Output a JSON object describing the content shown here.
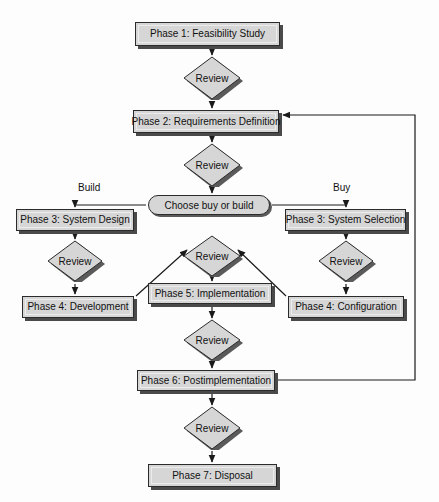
{
  "diagram": {
    "colors": {
      "node_fill": "#d6d6d6",
      "node_border": "#2b2b2b",
      "shadow": "#4a4a4a",
      "line": "#1a1a1a",
      "background": "#fdfdfd"
    },
    "process_nodes": [
      {
        "id": "phase1",
        "label": "Phase 1: Feasibility Study",
        "x": 135,
        "y": 22,
        "w": 145,
        "h": 24
      },
      {
        "id": "phase2",
        "label": "Phase 2: Requirements Definition",
        "x": 133,
        "y": 110,
        "w": 146,
        "h": 23
      },
      {
        "id": "phase3build",
        "label": "Phase 3: System Design",
        "x": 16,
        "y": 209,
        "w": 118,
        "h": 22
      },
      {
        "id": "phase3buy",
        "label": "Phase 3: System Selection",
        "x": 285,
        "y": 209,
        "w": 121,
        "h": 22
      },
      {
        "id": "phase4build",
        "label": "Phase 4: Development",
        "x": 22,
        "y": 296,
        "w": 112,
        "h": 22
      },
      {
        "id": "phase5",
        "label": "Phase 5: Implementation",
        "x": 148,
        "y": 283,
        "w": 124,
        "h": 21
      },
      {
        "id": "phase4buy",
        "label": "Phase 4: Configuration",
        "x": 288,
        "y": 296,
        "w": 116,
        "h": 22
      },
      {
        "id": "phase6",
        "label": "Phase 6: Postimplementation",
        "x": 137,
        "y": 370,
        "w": 138,
        "h": 21
      },
      {
        "id": "phase7",
        "label": "Phase 7: Disposal",
        "x": 148,
        "y": 464,
        "w": 129,
        "h": 23
      }
    ],
    "decision_nodes": [
      {
        "id": "review1",
        "label": "Review",
        "cx": 212,
        "cy": 78,
        "rx": 31,
        "ry": 22
      },
      {
        "id": "review2",
        "label": "Review",
        "cx": 212,
        "cy": 165,
        "rx": 31,
        "ry": 22
      },
      {
        "id": "review3",
        "label": "Review",
        "cx": 75,
        "cy": 261,
        "rx": 30,
        "ry": 21
      },
      {
        "id": "review4",
        "label": "Review",
        "cx": 212,
        "cy": 256,
        "rx": 31,
        "ry": 21
      },
      {
        "id": "review5",
        "label": "Review",
        "cx": 346,
        "cy": 261,
        "rx": 30,
        "ry": 21
      },
      {
        "id": "review6",
        "label": "Review",
        "cx": 212,
        "cy": 340,
        "rx": 31,
        "ry": 21
      },
      {
        "id": "review7",
        "label": "Review",
        "cx": 212,
        "cy": 428,
        "rx": 31,
        "ry": 22
      }
    ],
    "terminal_nodes": [
      {
        "id": "choose",
        "label": "Choose buy or build",
        "x": 148,
        "y": 195,
        "w": 122,
        "h": 20
      }
    ],
    "branch_labels": [
      {
        "id": "build-label",
        "text": "Build",
        "x": 78,
        "y": 182
      },
      {
        "id": "buy-label",
        "text": "Buy",
        "x": 333,
        "y": 182
      }
    ],
    "connectors": [
      {
        "id": "phase1-to-review1",
        "from": "phase1",
        "to": "review1",
        "kind": "arrow-down"
      },
      {
        "id": "review1-to-phase2",
        "from": "review1",
        "to": "phase2",
        "kind": "arrow-down"
      },
      {
        "id": "phase2-to-review2",
        "from": "phase2",
        "to": "review2",
        "kind": "arrow-down"
      },
      {
        "id": "review2-to-choose",
        "from": "review2",
        "to": "choose",
        "kind": "arrow-down"
      },
      {
        "id": "choose-to-phase3build",
        "from": "choose",
        "to": "phase3build",
        "kind": "elbow-left"
      },
      {
        "id": "choose-to-phase3buy",
        "from": "choose",
        "to": "phase3buy",
        "kind": "elbow-right"
      },
      {
        "id": "phase3build-to-review3",
        "from": "phase3build",
        "to": "review3",
        "kind": "arrow-down"
      },
      {
        "id": "review3-to-phase4build",
        "from": "review3",
        "to": "phase4build",
        "kind": "arrow-down"
      },
      {
        "id": "phase3buy-to-review5",
        "from": "phase3buy",
        "to": "review5",
        "kind": "arrow-down"
      },
      {
        "id": "review5-to-phase4buy",
        "from": "review5",
        "to": "phase4buy",
        "kind": "arrow-down"
      },
      {
        "id": "phase4build-to-review4",
        "from": "phase4build",
        "to": "review4",
        "kind": "diagonal-up-right"
      },
      {
        "id": "phase4buy-to-review4",
        "from": "phase4buy",
        "to": "review4",
        "kind": "diagonal-up-left"
      },
      {
        "id": "review4-to-phase5",
        "from": "review4",
        "to": "phase5",
        "kind": "arrow-down"
      },
      {
        "id": "phase5-to-review6",
        "from": "phase5",
        "to": "review6",
        "kind": "arrow-down"
      },
      {
        "id": "review6-to-phase6",
        "from": "review6",
        "to": "phase6",
        "kind": "arrow-down"
      },
      {
        "id": "phase6-to-review7",
        "from": "phase6",
        "to": "review7",
        "kind": "arrow-down"
      },
      {
        "id": "review7-to-phase7",
        "from": "review7",
        "to": "phase7",
        "kind": "arrow-down"
      },
      {
        "id": "phase6-feedback-to-phase2",
        "from": "phase6",
        "to": "phase2",
        "kind": "feedback-loop-right"
      }
    ]
  }
}
